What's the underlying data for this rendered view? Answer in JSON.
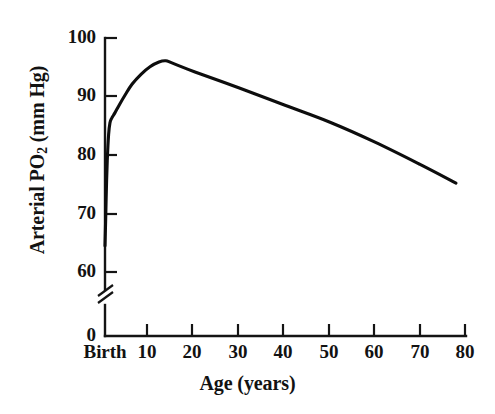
{
  "chart_data": {
    "type": "line",
    "title": "",
    "subtitle": "",
    "xlabel": "Age (years)",
    "ylabel_parts": {
      "lead": "Arterial PO",
      "sub": "2",
      "tail": " (mm Hg)"
    },
    "ylabel": "Arterial PO2 (mm Hg)",
    "xlim": [
      0,
      80
    ],
    "ylim": [
      60,
      100
    ],
    "y_axis_break": true,
    "y_break_between": [
      0,
      60
    ],
    "grid": false,
    "legend": null,
    "legend_position": "none",
    "line_color": "#0d0d0d",
    "axis_color": "#141414",
    "background_color": "#ffffff",
    "x_tick_labels": [
      "Birth",
      "10",
      "20",
      "30",
      "40",
      "50",
      "60",
      "70",
      "80"
    ],
    "x_tick_values": [
      0,
      10,
      20,
      30,
      40,
      50,
      60,
      70,
      80
    ],
    "y_tick_labels": [
      "0",
      "60",
      "70",
      "80",
      "90",
      "100"
    ],
    "y_tick_values": [
      0,
      60,
      70,
      80,
      90,
      100
    ],
    "x": [
      0,
      0.15,
      0.3,
      0.5,
      0.8,
      1.1,
      1.5,
      2.2,
      3.2,
      4.5,
      6,
      8,
      10,
      12,
      13.5,
      15,
      20,
      30,
      40,
      50,
      60,
      70,
      78
    ],
    "y": [
      64.5,
      69,
      74,
      79,
      83.5,
      85.5,
      86.3,
      87.2,
      88.6,
      90.3,
      92.1,
      93.8,
      95.1,
      95.9,
      96.1,
      95.7,
      94.2,
      91.4,
      88.5,
      85.6,
      82.2,
      78.4,
      75.2
    ],
    "values": [
      64.5,
      69,
      74,
      79,
      83.5,
      85.5,
      86.3,
      87.2,
      88.6,
      90.3,
      92.1,
      93.8,
      95.1,
      95.9,
      96.1,
      95.7,
      94.2,
      91.4,
      88.5,
      85.6,
      82.2,
      78.4,
      75.2
    ],
    "annotations": {
      "peak_age_years": 13.5,
      "peak_value_mmhg": 96,
      "birth_value_mmhg": 64.5,
      "end_age_years": 78,
      "end_value_mmhg": 75
    }
  },
  "axes": {
    "y_ticks": [
      {
        "label": "100"
      },
      {
        "label": "90"
      },
      {
        "label": "80"
      },
      {
        "label": "70"
      },
      {
        "label": "60"
      },
      {
        "label": "0"
      }
    ],
    "x_ticks": [
      {
        "label": "Birth"
      },
      {
        "label": "10"
      },
      {
        "label": "20"
      },
      {
        "label": "30"
      },
      {
        "label": "40"
      },
      {
        "label": "50"
      },
      {
        "label": "60"
      },
      {
        "label": "70"
      },
      {
        "label": "80"
      }
    ],
    "x_title": "Age (years)",
    "y_title_lead": "Arterial PO",
    "y_title_sub": "2",
    "y_title_tail": " (mm Hg)"
  }
}
